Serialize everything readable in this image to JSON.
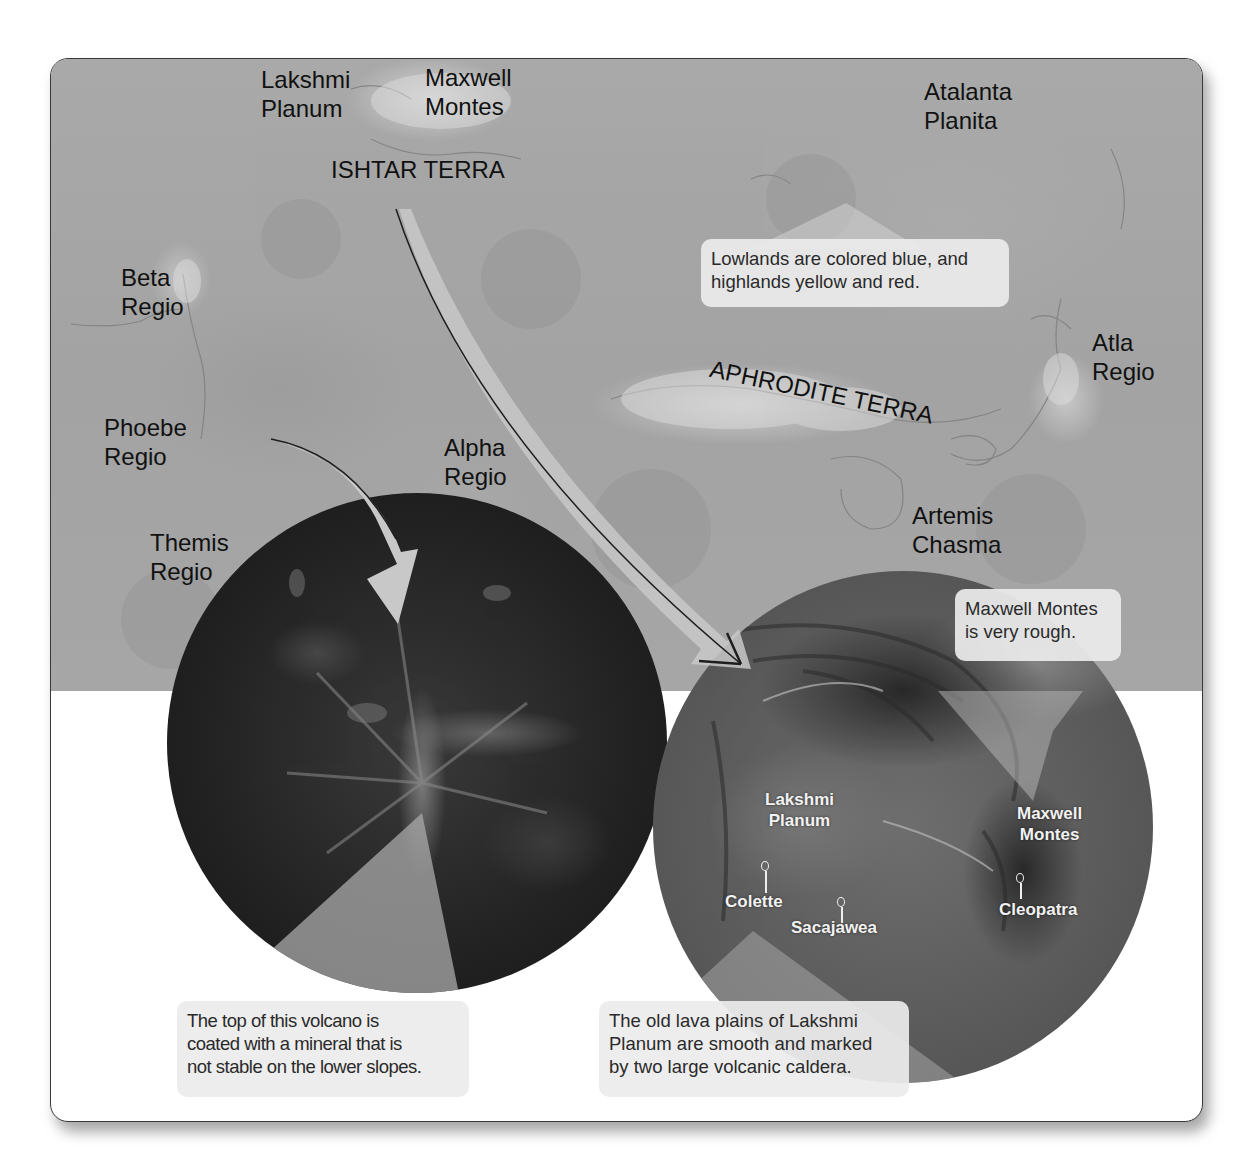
{
  "figure": {
    "map_labels": {
      "lakshmi_planum": "Lakshmi\nPlanum",
      "maxwell_montes": "Maxwell\nMontes",
      "ishtar_terra": "ISHTAR TERRA",
      "atalanta_planita": "Atalanta\nPlanita",
      "beta_regio": "Beta\nRegio",
      "phoebe_regio": "Phoebe\nRegio",
      "alpha_regio": "Alpha\nRegio",
      "themis_regio": "Themis\nRegio",
      "aphrodite_terra": "APHRODITE TERRA",
      "atla_regio": "Atla\nRegio",
      "artemis_chasma": "Artemis\nChasma"
    },
    "callouts": {
      "map_colors": "Lowlands are colored blue, and\nhighlands yellow and red.",
      "maxwell_rough": "Maxwell Montes\nis very rough.",
      "volcano_top": "The top of this volcano is\ncoated with a mineral that is\nnot stable on the lower slopes.",
      "lakshmi_plains": "The old lava plains of Lakshmi\nPlanum are smooth and marked\nby two large volcanic caldera."
    },
    "closeup_right_labels": {
      "lakshmi_planum": "Lakshmi\nPlanum",
      "maxwell_montes": "Maxwell\nMontes",
      "colette": "Colette",
      "sacajawea": "Sacajawea",
      "cleopatra": "Cleopatra"
    },
    "colors": {
      "map_gray": "#a6a6a6",
      "callout_bg": "#ececec",
      "frame_border": "#3a3a3a",
      "arrow_fill": "#c8c8c8"
    }
  }
}
